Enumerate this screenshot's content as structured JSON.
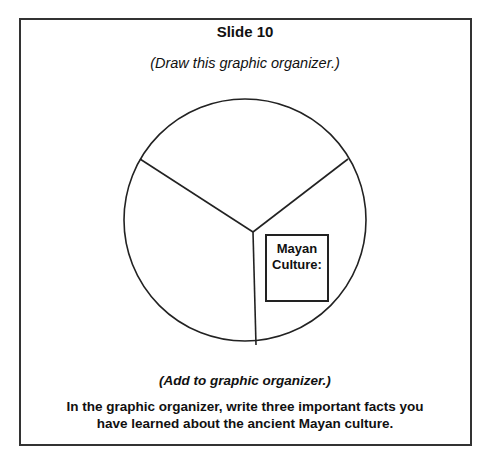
{
  "slide": {
    "title": "Slide 10",
    "subtitle": "(Draw this graphic organizer.)"
  },
  "organizer": {
    "type": "circle divided into three sections",
    "sections": 3,
    "label_box": {
      "line1": "Mayan",
      "line2": "Culture:"
    }
  },
  "instructions": {
    "heading": "(Add to graphic organizer.)",
    "line1": "In the graphic organizer, write three important facts you",
    "line2": "have learned about the ancient Mayan culture."
  }
}
